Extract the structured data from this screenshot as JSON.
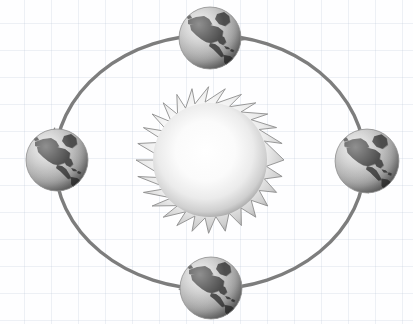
{
  "diagram": {
    "type": "orbital-diagram",
    "background": {
      "name": "graph-paper-grid",
      "color": "#fefeff",
      "grid_line_color": "#aab9cd",
      "grid_spacing_px": 27
    },
    "sun": {
      "label": "Sun",
      "center": {
        "x": 210,
        "y": 160
      },
      "core_radius": 58,
      "spike_radius": 75,
      "spike_count": 28,
      "core_color": "#ffffff",
      "edge_color": "#8a8a8a",
      "outline_color": "#8d8d8d"
    },
    "orbit": {
      "label": "Orbital Path",
      "center": {
        "x": 210,
        "y": 162
      },
      "radius_x": 155,
      "radius_y": 127,
      "stroke_color": "#7d7d7d",
      "stroke_width": 3.4,
      "direction": "counterclockwise"
    },
    "earths": [
      {
        "name": "earth-top",
        "position_label": "top",
        "center": {
          "x": 210,
          "y": 38
        },
        "radius": 31,
        "ocean_color": "#b4b4b4",
        "land_color": "#4a4a4a",
        "highlight_color": "#e2e2e2"
      },
      {
        "name": "earth-left",
        "position_label": "left",
        "center": {
          "x": 57,
          "y": 160
        },
        "radius": 31,
        "ocean_color": "#b4b4b4",
        "land_color": "#4a4a4a",
        "highlight_color": "#e2e2e2"
      },
      {
        "name": "earth-bottom",
        "position_label": "bottom",
        "center": {
          "x": 211,
          "y": 288
        },
        "radius": 31,
        "ocean_color": "#b4b4b4",
        "land_color": "#4a4a4a",
        "highlight_color": "#e2e2e2"
      },
      {
        "name": "earth-right",
        "position_label": "right",
        "center": {
          "x": 367,
          "y": 161
        },
        "radius": 32,
        "ocean_color": "#b4b4b4",
        "land_color": "#4a4a4a",
        "highlight_color": "#e2e2e2"
      }
    ],
    "arrows": [
      {
        "name": "arrow-to-top",
        "from": "right",
        "to": "top",
        "tip": {
          "x": 246,
          "y": 40
        },
        "heading_deg": 195,
        "color": "#7d7d7d"
      },
      {
        "name": "arrow-to-left",
        "from": "top",
        "to": "left",
        "tip": {
          "x": 56,
          "y": 125
        },
        "heading_deg": 103,
        "color": "#7d7d7d"
      },
      {
        "name": "arrow-to-bottom",
        "from": "left",
        "to": "bottom",
        "tip": {
          "x": 177,
          "y": 289
        },
        "heading_deg": 8,
        "color": "#7d7d7d"
      },
      {
        "name": "arrow-to-right",
        "from": "bottom",
        "to": "right",
        "tip": {
          "x": 368,
          "y": 196
        },
        "heading_deg": 285,
        "color": "#7d7d7d"
      }
    ]
  }
}
